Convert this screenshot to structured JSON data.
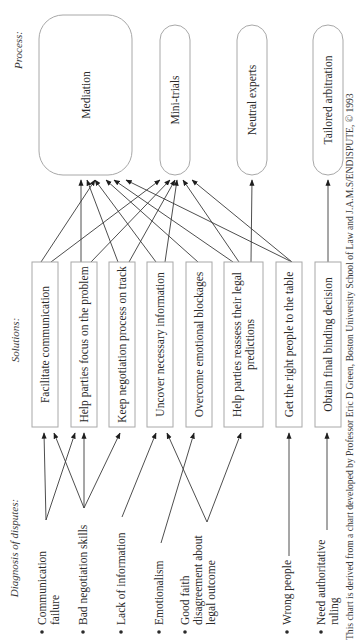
{
  "colors": {
    "box_stroke": "#a8a8a8",
    "line": "#3a3a3a",
    "text": "#2a2a2a",
    "background": "#ffffff"
  },
  "sections": {
    "process": {
      "label": "Process:",
      "x": 22,
      "y": 50
    },
    "solutions": {
      "label": "Solutions:",
      "x": 19,
      "y": 340
    },
    "diagnosis": {
      "label": "Diagnosis of disputes:",
      "x": 18,
      "y": 548
    }
  },
  "processes": [
    {
      "id": "mediation",
      "label": "Mediation",
      "x": 39,
      "y": 15,
      "w": 93,
      "h": 160,
      "r": 24
    },
    {
      "id": "mini-trials",
      "label": "Mini-trials",
      "x": 160,
      "y": 25,
      "w": 30,
      "h": 150,
      "r": 15
    },
    {
      "id": "neutral-experts",
      "label": "Neutral experts",
      "x": 237,
      "y": 25,
      "w": 30,
      "h": 150,
      "r": 15
    },
    {
      "id": "tailored-arbitration",
      "label": "Tailored arbitration",
      "x": 313,
      "y": 25,
      "w": 30,
      "h": 150,
      "r": 15
    }
  ],
  "solutions": [
    {
      "id": "facilitate-communication",
      "lines": [
        "Facilitate communication"
      ],
      "x": 32,
      "w": 26
    },
    {
      "id": "focus-on-problem",
      "lines": [
        "Help parties focus on the problem"
      ],
      "x": 71,
      "w": 26
    },
    {
      "id": "keep-on-track",
      "lines": [
        "Keep negotiation process on track"
      ],
      "x": 109,
      "w": 26
    },
    {
      "id": "uncover-information",
      "lines": [
        "Uncover necessary information"
      ],
      "x": 147,
      "w": 26
    },
    {
      "id": "overcome-blockages",
      "lines": [
        "Overcome emotional blockages"
      ],
      "x": 186,
      "w": 26
    },
    {
      "id": "reassess-predictions",
      "lines": [
        "Help parties reassess their legal",
        "predictions"
      ],
      "x": 224,
      "w": 39
    },
    {
      "id": "right-people",
      "lines": [
        "Get the right people to the table"
      ],
      "x": 276,
      "w": 26
    },
    {
      "id": "final-decision",
      "lines": [
        "Obtain final binding decision"
      ],
      "x": 315,
      "w": 26
    }
  ],
  "solution_box_y": {
    "top": 262,
    "bottom": 427
  },
  "diagnoses": [
    {
      "id": "communication-failure",
      "lines": [
        "Communication",
        "failure"
      ],
      "x": 43,
      "anchor": [
        46,
        520
      ]
    },
    {
      "id": "bad-negotiation-skills",
      "lines": [
        "Bad negotiation skills"
      ],
      "x": 84,
      "anchor": [
        84,
        508
      ]
    },
    {
      "id": "lack-of-information",
      "lines": [
        "Lack of information"
      ],
      "x": 122,
      "anchor": [
        122,
        517
      ]
    },
    {
      "id": "emotionalism",
      "lines": [
        "Emotionalism"
      ],
      "x": 160,
      "anchor": [
        161,
        543
      ]
    },
    {
      "id": "good-faith-disagreement",
      "lines": [
        "Good faith",
        "disagreement about",
        "legal outcome"
      ],
      "x": 186,
      "anchor": [
        207,
        522
      ]
    },
    {
      "id": "wrong-people",
      "lines": [
        "Wrong people"
      ],
      "x": 288,
      "anchor": [
        289,
        556
      ]
    },
    {
      "id": "need-authoritative-ruling",
      "lines": [
        "Need authoritative",
        "ruling"
      ],
      "x": 322,
      "anchor": [
        327,
        530
      ]
    }
  ],
  "diagnosis_text_bottom": 625,
  "solution_to_process_edges": [
    {
      "from": [
        41,
        262
      ],
      "to": [
        95,
        180
      ]
    },
    {
      "from": [
        51,
        262
      ],
      "to": [
        160,
        180
      ]
    },
    {
      "from": [
        81,
        262
      ],
      "to": [
        81,
        180
      ]
    },
    {
      "from": [
        91,
        262
      ],
      "to": [
        170,
        180
      ]
    },
    {
      "from": [
        118,
        262
      ],
      "to": [
        87,
        180
      ]
    },
    {
      "from": [
        129,
        262
      ],
      "to": [
        175,
        180
      ]
    },
    {
      "from": [
        156,
        262
      ],
      "to": [
        95,
        180
      ]
    },
    {
      "from": [
        165,
        262
      ],
      "to": [
        177,
        180
      ]
    },
    {
      "from": [
        198,
        262
      ],
      "to": [
        106,
        180
      ]
    },
    {
      "from": [
        233,
        262
      ],
      "to": [
        114,
        180
      ]
    },
    {
      "from": [
        239,
        262
      ],
      "to": [
        183,
        180
      ]
    },
    {
      "from": [
        251,
        262
      ],
      "to": [
        252,
        180
      ]
    },
    {
      "from": [
        292,
        262
      ],
      "to": [
        126,
        180
      ]
    },
    {
      "from": [
        292,
        262
      ],
      "to": [
        192,
        180
      ]
    },
    {
      "from": [
        328,
        262
      ],
      "to": [
        328,
        180
      ]
    }
  ],
  "diagnosis_to_solution_edges": [
    {
      "from": [
        46,
        520
      ],
      "to": [
        44,
        433
      ]
    },
    {
      "from": [
        46,
        520
      ],
      "to": [
        75,
        433
      ]
    },
    {
      "from": [
        84,
        508
      ],
      "to": [
        54,
        433
      ]
    },
    {
      "from": [
        84,
        508
      ],
      "to": [
        84,
        433
      ]
    },
    {
      "from": [
        84,
        508
      ],
      "to": [
        120,
        433
      ]
    },
    {
      "from": [
        122,
        517
      ],
      "to": [
        156,
        433
      ]
    },
    {
      "from": [
        161,
        543
      ],
      "to": [
        194,
        433
      ]
    },
    {
      "from": [
        207,
        522
      ],
      "to": [
        167,
        433
      ]
    },
    {
      "from": [
        207,
        522
      ],
      "to": [
        241,
        433
      ]
    },
    {
      "from": [
        289,
        556
      ],
      "to": [
        289,
        433
      ]
    },
    {
      "from": [
        327,
        530
      ],
      "to": [
        327,
        433
      ]
    }
  ],
  "credit": {
    "text": "This chart is derived from a chart developed by Professor Eric D Green, Boston University School of Law and J.A.M.S/ENDISPUTE, © 1993",
    "x": 353,
    "y": 640
  }
}
